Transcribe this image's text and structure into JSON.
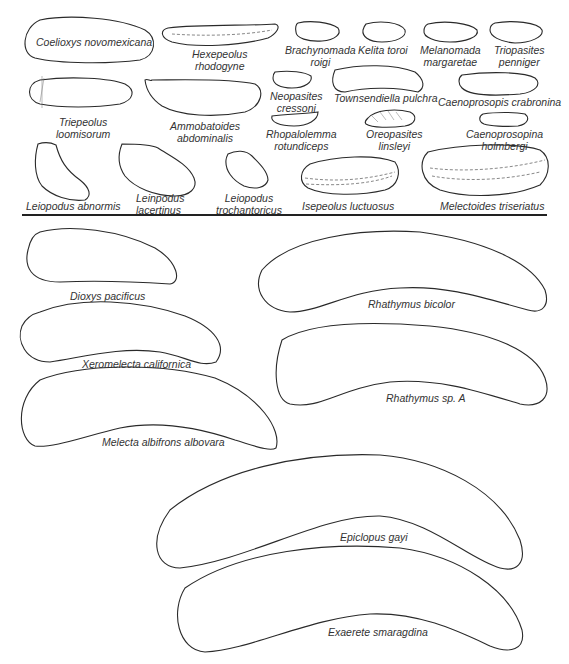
{
  "figure": {
    "top_panel": {
      "specimens": [
        {
          "id": "coelioxys",
          "name": "Coelioxys novomexicana"
        },
        {
          "id": "hexepeolus",
          "line1": "Hexepeolus",
          "line2": "rhodogyne"
        },
        {
          "id": "brachynomada",
          "line1": "Brachynomada",
          "line2": "roigi"
        },
        {
          "id": "kelita",
          "name": "Kelita toroi"
        },
        {
          "id": "melanomada",
          "line1": "Melanomada",
          "line2": "margaretae"
        },
        {
          "id": "triopasites",
          "line1": "Triopasites",
          "line2": "penniger"
        },
        {
          "id": "triepeolus",
          "line1": "Triepeolus",
          "line2": "loomisorum"
        },
        {
          "id": "ammobatoides",
          "line1": "Ammobatoides",
          "line2": "abdominalis"
        },
        {
          "id": "neopasites",
          "line1": "Neopasites",
          "line2": "cressoni"
        },
        {
          "id": "townsendiella",
          "name": "Townsendiella pulchra"
        },
        {
          "id": "caenoprosopis",
          "name": "Caenoprosopis crabronina"
        },
        {
          "id": "rhopalolemma",
          "line1": "Rhopalolemma",
          "line2": "rotundiceps"
        },
        {
          "id": "oreopasites",
          "line1": "Oreopasites",
          "line2": "linsleyi"
        },
        {
          "id": "caenoprosopina",
          "line1": "Caenoprosopina",
          "line2": "holmbergi"
        },
        {
          "id": "leiopodus-abnormis",
          "name": "Leiopodus abnormis"
        },
        {
          "id": "leinpodus-lacertinus",
          "line1": "Leinpodus",
          "line2": "lacertinus"
        },
        {
          "id": "leiopodus-trochantoricus",
          "line1": "Leiopodus",
          "line2": "trochantoricus"
        },
        {
          "id": "isepeolus",
          "name": "Isepeolus luctuosus"
        },
        {
          "id": "melectoides",
          "name": "Melectoides triseriatus"
        }
      ]
    },
    "bottom_panel": {
      "specimens": [
        {
          "id": "dioxys",
          "name": "Dioxys pacificus"
        },
        {
          "id": "rhathymus-bicolor",
          "name": "Rhathymus bicolor"
        },
        {
          "id": "xeromelecta",
          "name": "Xeromelecta californica"
        },
        {
          "id": "rhathymus-spa",
          "name": "Rhathymus sp. A"
        },
        {
          "id": "melecta",
          "name": "Melecta albifrons albovara"
        },
        {
          "id": "epiclopus",
          "name": "Epiclopus gayi"
        },
        {
          "id": "exaerete",
          "name": "Exaerete smaragdina"
        }
      ]
    }
  }
}
